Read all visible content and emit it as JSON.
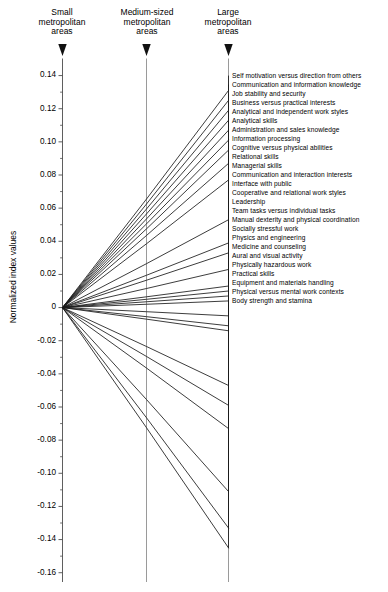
{
  "chart_data": {
    "type": "line",
    "title": "",
    "subtitle": "",
    "ylabel": "Normalized index values",
    "xlabel": "",
    "grid": false,
    "legend_position": "right-labels",
    "categories": [
      "Small metropolitan areas",
      "Medium-sized metropolitan areas",
      "Large metropolitan areas"
    ],
    "ylim": [
      -0.16,
      0.15
    ],
    "yticks": [
      0.14,
      0.12,
      0.1,
      0.08,
      0.06,
      0.04,
      0.02,
      0,
      -0.02,
      -0.04,
      -0.06,
      -0.08,
      -0.1,
      -0.12,
      -0.14,
      -0.16
    ],
    "ytick_labels": [
      "0.14",
      "0.12",
      "0.10",
      "0.08",
      "0.06",
      "0.04",
      "0.02",
      "0",
      "-0.02",
      "-0.04",
      "-0.06",
      "-0.08",
      "-0.10",
      "-0.12",
      "-0.14",
      "-0.16"
    ],
    "minor_ticks": [
      0.13,
      0.11,
      0.09,
      0.07,
      0.05,
      0.03,
      0.01,
      -0.01,
      -0.03,
      -0.05,
      -0.07,
      -0.09,
      -0.11,
      -0.13,
      -0.15
    ],
    "x": [
      0,
      1,
      2
    ],
    "series": [
      {
        "name": "Self motivation versus direction from others",
        "values": [
          0,
          0.0655,
          0.131
        ]
      },
      {
        "name": "Communication and information knowledge",
        "values": [
          0,
          0.0625,
          0.125
        ]
      },
      {
        "name": "Job stability and security",
        "values": [
          0,
          0.0595,
          0.119
        ]
      },
      {
        "name": "Business versus practical interests",
        "values": [
          0,
          0.0565,
          0.113
        ]
      },
      {
        "name": "Analytical and independent work styles",
        "values": [
          0,
          0.0535,
          0.107
        ]
      },
      {
        "name": "Analytical skills",
        "values": [
          0,
          0.0505,
          0.101
        ]
      },
      {
        "name": "Administration and sales knowledge",
        "values": [
          0,
          0.0475,
          0.095
        ]
      },
      {
        "name": "Information processing",
        "values": [
          0,
          0.0435,
          0.087
        ]
      },
      {
        "name": "Cognitive versus physical abilities",
        "values": [
          0,
          0.0385,
          0.077
        ]
      },
      {
        "name": "Relational skills",
        "values": [
          0,
          0.0265,
          0.053
        ]
      },
      {
        "name": "Managerial skills",
        "values": [
          0,
          0.0195,
          0.039
        ]
      },
      {
        "name": "Communication and interaction interests",
        "values": [
          0,
          0.0165,
          0.033
        ]
      },
      {
        "name": "Interface with public",
        "values": [
          0,
          0.0115,
          0.023
        ]
      },
      {
        "name": "Cooperative and relational work styles",
        "values": [
          0,
          0.0065,
          0.013
        ]
      },
      {
        "name": "Leadership",
        "values": [
          0,
          0.005,
          0.01
        ]
      },
      {
        "name": "Team tasks versus individual tasks",
        "values": [
          0,
          0.0035,
          0.007
        ]
      },
      {
        "name": "Manual dexterity and physical coordination",
        "values": [
          0,
          0.002,
          0.004
        ]
      },
      {
        "name": "Socially stressful work",
        "values": [
          0,
          -0.0025,
          -0.005
        ]
      },
      {
        "name": "Physics and engineering",
        "values": [
          0,
          -0.0055,
          -0.011
        ]
      },
      {
        "name": "Medicine and counseling",
        "values": [
          0,
          -0.007,
          -0.014
        ]
      },
      {
        "name": "Aural and visual activity",
        "values": [
          0,
          -0.0235,
          -0.047
        ]
      },
      {
        "name": "Physically hazardous work",
        "values": [
          0,
          -0.0295,
          -0.059
        ]
      },
      {
        "name": "Practical skills",
        "values": [
          0,
          -0.0365,
          -0.073
        ]
      },
      {
        "name": "Equipment and materials handling",
        "values": [
          0,
          -0.0555,
          -0.111
        ]
      },
      {
        "name": "Physical versus mental work contexts",
        "values": [
          0,
          -0.0665,
          -0.133
        ]
      },
      {
        "name": "Body strength and stamina",
        "values": [
          0,
          -0.0725,
          -0.145
        ]
      }
    ]
  },
  "columns": [
    {
      "id": "small",
      "line1": "Small",
      "line2": "metropolitan",
      "line3": "areas"
    },
    {
      "id": "medium",
      "line1": "Medium-sized",
      "line2": "metropolitan",
      "line3": "areas"
    },
    {
      "id": "large",
      "line1": "Large",
      "line2": "metropolitan",
      "line3": "areas"
    }
  ],
  "axis": {
    "y_title": "Normalized index values"
  },
  "colors": {
    "line": "#1a1a1a",
    "axis": "#4d4d4d",
    "text": "#000000",
    "background": "#ffffff"
  }
}
